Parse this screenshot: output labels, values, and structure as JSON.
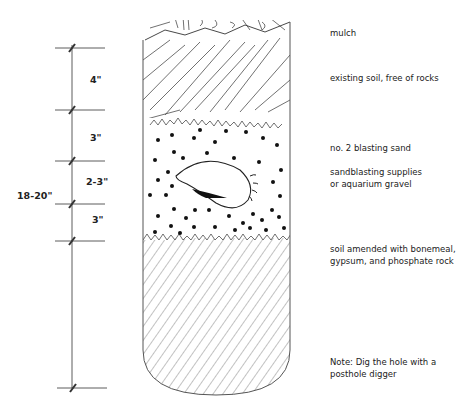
{
  "figure": {
    "total_depth_label": "18-20\"",
    "dimensions": [
      {
        "label": "4\"",
        "layer": "existing soil"
      },
      {
        "label": "3\"",
        "layer": "blasting sand above bulb"
      },
      {
        "label": "2-3\"",
        "layer": "bulb"
      },
      {
        "label": "3\"",
        "layer": "blasting sand below bulb"
      }
    ],
    "layer_labels": [
      {
        "id": "mulch",
        "lines": [
          "mulch"
        ]
      },
      {
        "id": "existing-soil",
        "lines": [
          "existing soil, free of rocks"
        ]
      },
      {
        "id": "blasting-sand",
        "lines": [
          "no. 2 blasting sand"
        ]
      },
      {
        "id": "sand-source",
        "lines": [
          "sandblasting supplies",
          "or aquarium gravel"
        ]
      },
      {
        "id": "amended-soil",
        "lines": [
          "soil amended with bonemeal,",
          "gypsum, and phosphate rock"
        ]
      },
      {
        "id": "note",
        "lines": [
          "Note: Dig the hole with a",
          "posthole digger"
        ]
      }
    ],
    "colors": {
      "ink": "#222222",
      "hatch": "#555555",
      "background": "#ffffff"
    }
  }
}
